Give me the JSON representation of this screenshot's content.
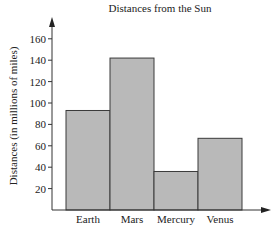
{
  "chart_data": {
    "type": "bar",
    "title": "Distances from the Sun",
    "xlabel": "",
    "ylabel": "Distances (in millions of miles)",
    "categories": [
      "Earth",
      "Mars",
      "Mercury",
      "Venus"
    ],
    "values": [
      93,
      142,
      36,
      67
    ],
    "ylim": [
      0,
      170
    ],
    "yticks": [
      20,
      40,
      60,
      80,
      100,
      120,
      140,
      160
    ],
    "grid": false,
    "legend": null,
    "colors": {
      "bar_fill": "#b9b9b9",
      "bar_edge": "#3a3a3a",
      "axis": "#333333"
    }
  }
}
